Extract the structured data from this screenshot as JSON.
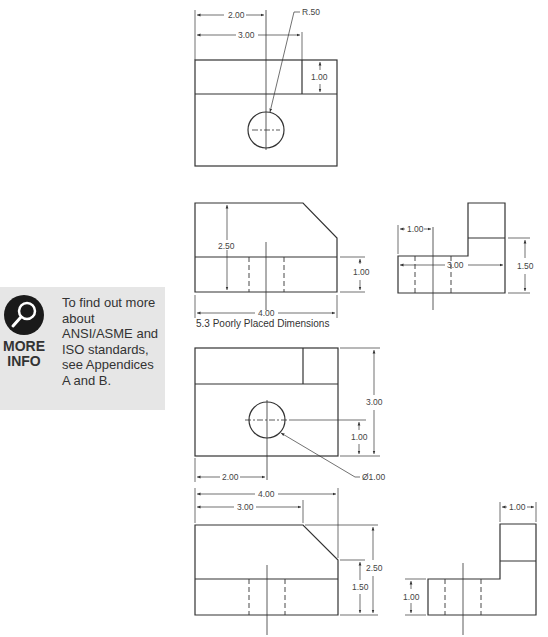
{
  "info_box": {
    "icon": "magnifier-icon",
    "label_line1": "MORE",
    "label_line2": "INFO",
    "text": "To find out more about ANSI/ASME and ISO standards, see Appendices A and B."
  },
  "caption": "5.3  Poorly Placed Dimensions",
  "poor": {
    "top_view": {
      "dim_a": "2.00",
      "dim_b": "3.00",
      "radius": "R.50",
      "height": "1.00"
    },
    "front_view": {
      "height": "2.50",
      "lower": "1.00",
      "width": "4.00"
    },
    "side_view": {
      "step": "1.00",
      "width": "3.00",
      "height": "1.50"
    }
  },
  "good": {
    "top_view": {
      "total": "3.00",
      "hole_y": "1.00",
      "hole_x": "2.00",
      "diameter": "Ø1.00"
    },
    "front_view": {
      "width": "4.00",
      "chamfer": "3.00",
      "total_height": "2.50",
      "lower": "1.50"
    },
    "side_view": {
      "step": "1.00",
      "lower": "1.00"
    }
  }
}
